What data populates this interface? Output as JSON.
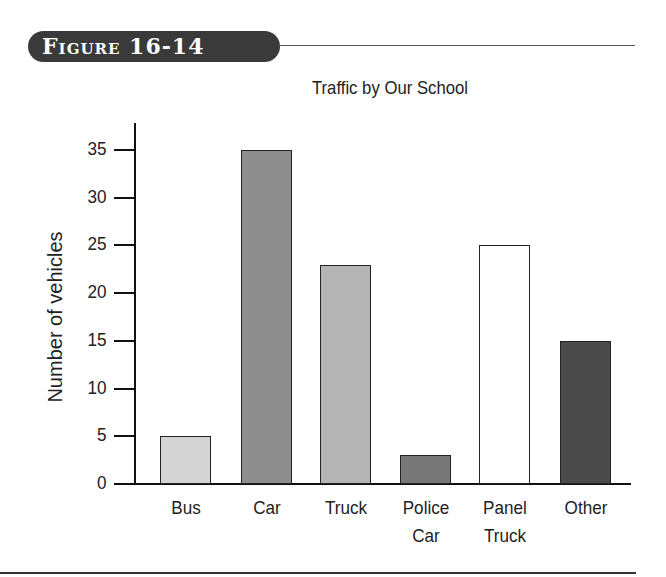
{
  "figure": {
    "label": "Figure 16-14"
  },
  "chart_data": {
    "type": "bar",
    "title": "Traffic by Our School",
    "xlabel": "",
    "ylabel": "Number of vehicles",
    "categories": [
      "Bus",
      "Car",
      "Truck",
      "Police Car",
      "Panel Truck",
      "Other"
    ],
    "category_lines": [
      [
        "Bus"
      ],
      [
        "Car"
      ],
      [
        "Truck"
      ],
      [
        "Police",
        "Car"
      ],
      [
        "Panel",
        "Truck"
      ],
      [
        "Other"
      ]
    ],
    "values": [
      5,
      35,
      23,
      3,
      25,
      15
    ],
    "ylim": [
      0,
      35
    ],
    "yticks": [
      0,
      5,
      10,
      15,
      20,
      25,
      30,
      35
    ],
    "grid": false,
    "legend": null,
    "bar_colors": [
      "#d4d4d4",
      "#8e8e8e",
      "#b4b4b4",
      "#777777",
      "#ffffff",
      "#4a4a4a"
    ]
  }
}
